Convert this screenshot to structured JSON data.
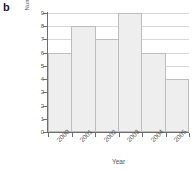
{
  "panel": {
    "label": "b"
  },
  "chart_data": {
    "type": "bar",
    "title": "",
    "subtitle": "",
    "xlabel": "Year",
    "ylabel": "Number of accidents",
    "categories": [
      "2000",
      "2001",
      "2002",
      "2003",
      "2004",
      "2005"
    ],
    "values": [
      6,
      8,
      7,
      9,
      6,
      4
    ],
    "series": [
      {
        "name": "Number of accidents",
        "values": [
          6,
          8,
          7,
          9,
          6,
          4
        ]
      }
    ],
    "ylim": [
      0,
      9
    ],
    "ytick_labels": [
      "0",
      "1",
      "2",
      "3",
      "4",
      "5",
      "6",
      "7",
      "8",
      "9"
    ],
    "ytick_values": [
      0,
      1,
      2,
      3,
      4,
      5,
      6,
      7,
      8,
      9
    ],
    "xtick_labels": [
      "2000",
      "2001",
      "2002",
      "2003",
      "2004",
      "2005"
    ],
    "grid": "horizontal",
    "legend": "none",
    "legend_position": "",
    "annotations": [],
    "bar_style": {
      "fill_color": "#eeeeee",
      "border_color": "#bdbdbd",
      "adjacent": true
    },
    "axis_color": "#6e6e6e",
    "gridline_color": "#d8d8d8",
    "text_color": "#555555",
    "xtick_label_rotation_deg": -45,
    "ylabel_rotation_deg": -90
  }
}
